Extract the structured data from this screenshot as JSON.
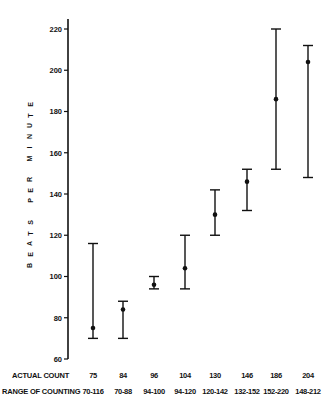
{
  "chart_data": {
    "type": "errorbar",
    "title": "",
    "xlabel": "",
    "ylabel": "BEATS PER MINUTE",
    "ylim": [
      60,
      220
    ],
    "yticks": [
      60,
      80,
      100,
      120,
      140,
      160,
      180,
      200,
      220
    ],
    "grid": false,
    "legend": null,
    "categories": [
      "75",
      "84",
      "96",
      "104",
      "130",
      "146",
      "186",
      "204"
    ],
    "series": [
      {
        "name": "Actual Count",
        "values": [
          75,
          84,
          96,
          104,
          130,
          146,
          186,
          204
        ]
      },
      {
        "name": "Range of Counting (low)",
        "values": [
          70,
          70,
          94,
          94,
          120,
          132,
          152,
          148
        ]
      },
      {
        "name": "Range of Counting (high)",
        "values": [
          116,
          88,
          100,
          120,
          142,
          152,
          220,
          212
        ]
      }
    ],
    "table_rows": [
      {
        "label": "ACTUAL COUNT",
        "cells": [
          "75",
          "84",
          "96",
          "104",
          "130",
          "146",
          "186",
          "204"
        ]
      },
      {
        "label": "RANGE OF COUNTING",
        "cells": [
          "70-116",
          "70-88",
          "94-100",
          "94-120",
          "120-142",
          "132-152",
          "152-220",
          "148-212"
        ]
      }
    ]
  },
  "labels": {
    "ylabel": "BEATS PER MINUTE",
    "actual_count": "ACTUAL COUNT",
    "range_of_counting": "RANGE OF COUNTING"
  }
}
